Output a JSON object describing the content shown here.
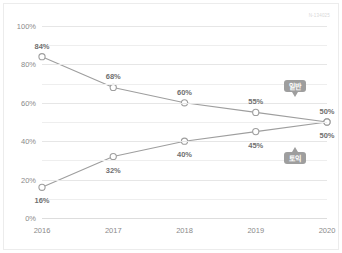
{
  "figure": {
    "watermark": "N-134025"
  },
  "chart_data": {
    "type": "line",
    "title": "",
    "subtitle": "",
    "xlabel": "",
    "ylabel": "",
    "x": [
      "2016",
      "2017",
      "2018",
      "2019",
      "2020"
    ],
    "categories": [
      "2016",
      "2017",
      "2018",
      "2019",
      "2020"
    ],
    "ylim": [
      0,
      100
    ],
    "yticks": [
      0,
      20,
      40,
      60,
      80,
      100
    ],
    "ytick_labels": [
      "0%",
      "20%",
      "40%",
      "60%",
      "80%",
      "100%"
    ],
    "grid": true,
    "grid_minor_step": 10,
    "legend_position": "inline-callout",
    "series": [
      {
        "name": "일반",
        "values": [
          84,
          68,
          60,
          55,
          50
        ],
        "data_labels": [
          "84%",
          "68%",
          "60%",
          "55%",
          "50%"
        ],
        "color": "#9e9e9e",
        "marker": "open-circle"
      },
      {
        "name": "토익",
        "values": [
          16,
          32,
          40,
          45,
          50
        ],
        "data_labels": [
          "16%",
          "32%",
          "40%",
          "45%",
          "50%"
        ],
        "color": "#9e9e9e",
        "marker": "open-circle"
      }
    ],
    "annotations": [
      {
        "text": "일반",
        "series": 0,
        "point_index": 4
      },
      {
        "text": "토익",
        "series": 1,
        "point_index": 4
      }
    ],
    "colors": {
      "line": "#9e9e9e",
      "marker_fill": "#ffffff",
      "marker_stroke": "#9e9e9e",
      "grid": "#eeeeee",
      "axis_text": "#8a8a8a",
      "label_text": "#6f6f6f",
      "callout_bg": "#9e9e9e",
      "callout_text": "#ffffff",
      "background": "#ffffff",
      "frame": "#ececec"
    }
  }
}
